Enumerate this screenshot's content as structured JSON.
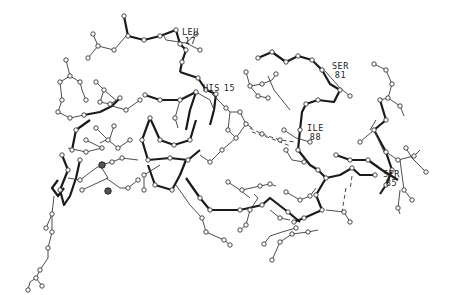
{
  "diagram": {
    "type": "ball-and-stick molecular structure",
    "residue_labels": [
      {
        "name": "LEU",
        "number": "17"
      },
      {
        "name": "HIS",
        "number": "15"
      },
      {
        "name": "SER",
        "number": "81"
      },
      {
        "name": "ILE",
        "number": "88"
      },
      {
        "name": "SER",
        "number": "85"
      }
    ],
    "colors": {
      "background": "#ffffff",
      "bonds": "#1a1a1a",
      "atoms": "#ffffff"
    }
  }
}
